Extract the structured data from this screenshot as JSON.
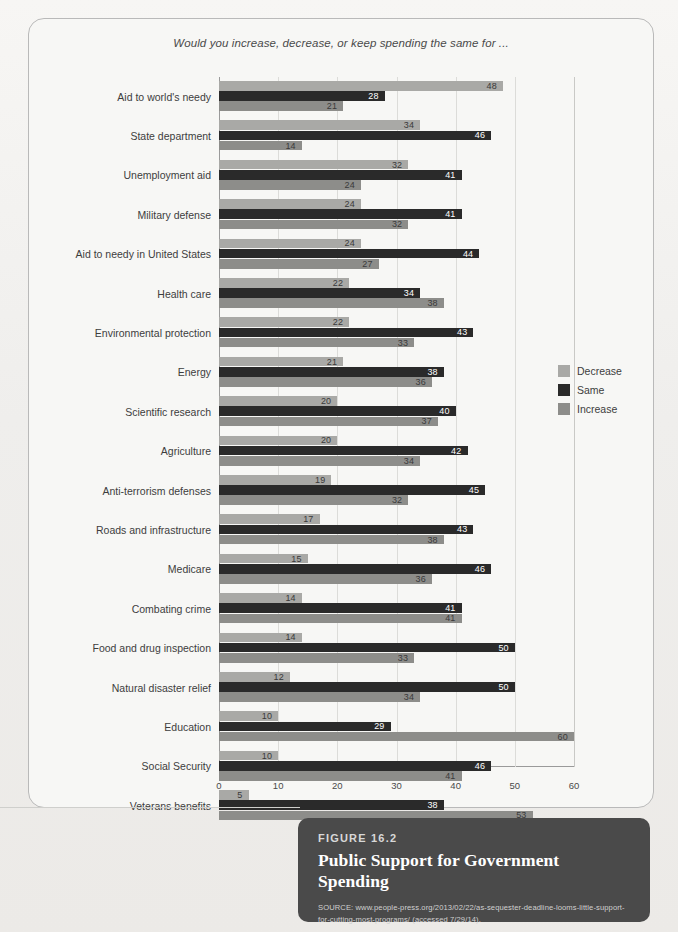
{
  "figure": {
    "number_label": "FIGURE 16.2",
    "title": "Public Support for Government Spending",
    "source": "SOURCE: www.people-press.org/2013/02/22/as-sequester-deadline-looms-little-support-for-cutting-most-programs/ (accessed 7/29/14)."
  },
  "legend": {
    "position": "right",
    "entries": [
      {
        "label": "Decrease",
        "color": "#a9a9a6"
      },
      {
        "label": "Same",
        "color": "#2a2a2a"
      },
      {
        "label": "Increase",
        "color": "#8d8d8a"
      }
    ]
  },
  "chart_data": {
    "type": "bar",
    "orientation": "horizontal",
    "title": "Would you increase, decrease, or keep spending the same for ...",
    "xlabel": "",
    "ylabel": "",
    "xlim": [
      0,
      60
    ],
    "xticks": [
      0,
      10,
      20,
      30,
      40,
      50,
      60
    ],
    "grid": true,
    "grouped": true,
    "bar_order": [
      "Decrease",
      "Same",
      "Increase"
    ],
    "categories": [
      "Aid to world's needy",
      "State department",
      "Unemployment aid",
      "Military defense",
      "Aid to needy in United States",
      "Health care",
      "Environmental protection",
      "Energy",
      "Scientific research",
      "Agriculture",
      "Anti-terrorism defenses",
      "Roads and infrastructure",
      "Medicare",
      "Combating crime",
      "Food and drug inspection",
      "Natural disaster relief",
      "Education",
      "Social Security",
      "Veterans benefits"
    ],
    "series": [
      {
        "name": "Decrease",
        "color": "#a9a9a6",
        "values": [
          48,
          34,
          32,
          24,
          24,
          22,
          22,
          21,
          20,
          20,
          19,
          17,
          15,
          14,
          14,
          12,
          10,
          10,
          5
        ]
      },
      {
        "name": "Same",
        "color": "#2a2a2a",
        "values": [
          28,
          46,
          41,
          41,
          44,
          34,
          43,
          38,
          40,
          42,
          45,
          43,
          46,
          41,
          50,
          50,
          29,
          46,
          38
        ]
      },
      {
        "name": "Increase",
        "color": "#8d8d8a",
        "values": [
          21,
          14,
          24,
          32,
          27,
          38,
          33,
          36,
          37,
          34,
          32,
          38,
          36,
          41,
          33,
          34,
          60,
          41,
          53
        ]
      }
    ]
  }
}
